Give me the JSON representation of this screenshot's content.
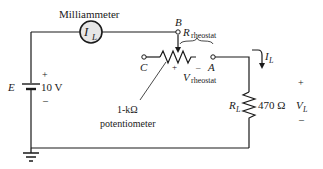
{
  "diagram": {
    "type": "circuit",
    "meter": {
      "label": "Milliammeter",
      "symbol": "I",
      "subscript": "L"
    },
    "source": {
      "name": "E",
      "value": "10 V",
      "plus": "+",
      "minus": "–"
    },
    "potentiometer": {
      "label_line1": "1-kΩ",
      "label_line2": "potentiometer",
      "terminals": {
        "a": "A",
        "b": "B",
        "c": "C"
      },
      "resistance_label": "R",
      "resistance_sub": "rheostat",
      "voltage_label": "V",
      "voltage_sub": "rheostat",
      "plus": "+",
      "minus": "–"
    },
    "load": {
      "name": "R",
      "name_sub": "L",
      "value": "470 Ω",
      "current": "I",
      "current_sub": "L",
      "voltage": "V",
      "voltage_sub": "L",
      "plus": "+",
      "minus": "–"
    },
    "colors": {
      "wire": "#1a1a1a",
      "meter_fill": "#e6e6e6"
    }
  }
}
